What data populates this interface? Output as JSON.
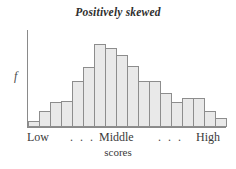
{
  "chart_data": {
    "type": "bar",
    "title": "Positively skewed",
    "xlabel": "scores",
    "ylabel": "f",
    "grid": false,
    "legend": null,
    "ylim": [
      0,
      100
    ],
    "axis_tick_labels": [
      "Low",
      ". . .",
      "Middle",
      ". . .",
      "High"
    ],
    "categories": [
      "1",
      "2",
      "3",
      "4",
      "5",
      "6",
      "7",
      "8",
      "9",
      "10",
      "11",
      "12",
      "13",
      "14",
      "15",
      "16",
      "17",
      "18"
    ],
    "values": [
      6,
      17,
      26,
      27,
      47,
      62,
      86,
      81,
      74,
      63,
      47,
      47,
      35,
      26,
      30,
      30,
      17,
      9
    ]
  },
  "axis": {
    "y_label": "f",
    "x_caption": "scores",
    "tick_low": "Low",
    "tick_dots_left": ". . .",
    "tick_middle": "Middle",
    "tick_dots_right": ". . .",
    "tick_high": "High"
  },
  "style": {
    "bar_fill": "#e9e9e9",
    "bar_stroke": "#8d8d8d",
    "axis_color": "#8a8a8a",
    "text_color": "#3a3a3a",
    "background": "#ffffff"
  }
}
